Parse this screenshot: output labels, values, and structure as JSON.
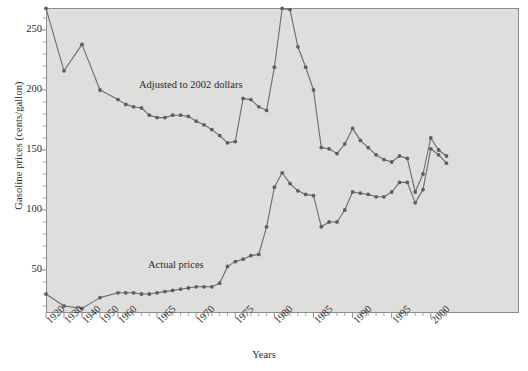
{
  "chart_data": {
    "type": "line",
    "title": "",
    "xlabel": "Years",
    "ylabel": "Gasoline prices (cents/gallon)",
    "ylim": [
      0,
      280
    ],
    "yticks": [
      50,
      100,
      150,
      200,
      250
    ],
    "xlim": [
      1920,
      2002
    ],
    "xticks": [
      1920,
      1930,
      1940,
      1950,
      1960,
      1965,
      1970,
      1975,
      1980,
      1985,
      1990,
      1995,
      2000
    ],
    "xtick_labels": [
      "1920",
      "1930",
      "1940",
      "1950",
      "1960",
      "1965",
      "1970",
      "1975",
      "1980",
      "1985",
      "1990",
      "1995",
      "2000"
    ],
    "grid": false,
    "legend_position": "inline-annotations",
    "annotations": [
      {
        "text": "Adjusted to 2002 dollars",
        "series": "adjusted"
      },
      {
        "text": "Actual prices",
        "series": "actual"
      }
    ],
    "series": [
      {
        "name": "Adjusted to 2002 dollars",
        "x": [
          1920,
          1930,
          1940,
          1950,
          1960,
          1961,
          1962,
          1963,
          1964,
          1965,
          1966,
          1967,
          1968,
          1969,
          1970,
          1971,
          1972,
          1973,
          1974,
          1975,
          1976,
          1977,
          1978,
          1979,
          1980,
          1981,
          1982,
          1983,
          1984,
          1985,
          1986,
          1987,
          1988,
          1989,
          1990,
          1991,
          1992,
          1993,
          1994,
          1995,
          1996,
          1997,
          1998,
          1999,
          2000,
          2001,
          2002
        ],
        "values": [
          268,
          216,
          238,
          200,
          192,
          188,
          186,
          185,
          179,
          177,
          177,
          179,
          179,
          178,
          174,
          171,
          167,
          162,
          156,
          157,
          193,
          192,
          186,
          183,
          219,
          268,
          267,
          236,
          219,
          200,
          152,
          151,
          147,
          155,
          168,
          158,
          152,
          146,
          142,
          140,
          145,
          143,
          115,
          130,
          160,
          150,
          145
        ]
      },
      {
        "name": "Actual prices",
        "x": [
          1920,
          1930,
          1940,
          1950,
          1960,
          1961,
          1962,
          1963,
          1964,
          1965,
          1966,
          1967,
          1968,
          1969,
          1970,
          1971,
          1972,
          1973,
          1974,
          1975,
          1976,
          1977,
          1978,
          1979,
          1980,
          1981,
          1982,
          1983,
          1984,
          1985,
          1986,
          1987,
          1988,
          1989,
          1990,
          1991,
          1992,
          1993,
          1994,
          1995,
          1996,
          1997,
          1998,
          1999,
          2000,
          2001,
          2002
        ],
        "values": [
          30,
          20,
          18,
          27,
          31,
          31,
          31,
          30,
          30,
          31,
          32,
          33,
          34,
          35,
          36,
          36,
          36,
          39,
          53,
          57,
          59,
          62,
          63,
          86,
          119,
          131,
          122,
          116,
          113,
          112,
          86,
          90,
          90,
          100,
          115,
          114,
          113,
          111,
          111,
          115,
          123,
          123,
          106,
          117,
          151,
          146,
          139
        ]
      }
    ]
  },
  "axes": {
    "y_title": "Gasoline prices (cents/gallon)",
    "x_title": "Years",
    "y_tick_labels": [
      "250",
      "200",
      "150",
      "100",
      "50"
    ],
    "x_tick_labels": [
      "1920",
      "1930",
      "1940",
      "1950",
      "1960",
      "1965",
      "1970",
      "1975",
      "1980",
      "1985",
      "1990",
      "1995",
      "2000"
    ]
  },
  "labels": {
    "adjusted": "Adjusted to 2002 dollars",
    "actual": "Actual prices"
  },
  "colors": {
    "plot_background": "#dededd",
    "frame": "#8d8d8d",
    "line": "#6a6a70",
    "marker": "#5d5d64",
    "text": "#2b2b2b"
  }
}
